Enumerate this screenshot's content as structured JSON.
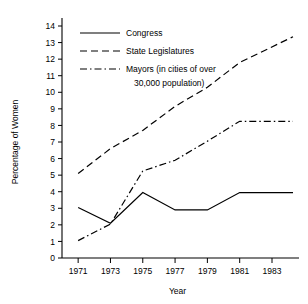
{
  "chart_data": {
    "type": "line",
    "title": "",
    "xlabel": "Year",
    "ylabel": "Percentage of Women",
    "xlim": [
      1970,
      1984.3
    ],
    "ylim": [
      0,
      14
    ],
    "grid": false,
    "legend_position": "top-left",
    "x_ticks": [
      "1971",
      "1973",
      "1975",
      "1977",
      "1979",
      "1981",
      "1983"
    ],
    "x_tick_values": [
      1971,
      1973,
      1975,
      1977,
      1979,
      1981,
      1983
    ],
    "y_ticks": [
      "0",
      "1",
      "2",
      "3",
      "4",
      "5",
      "6",
      "7",
      "8",
      "9",
      "10",
      "11",
      "12",
      "13",
      "14"
    ],
    "y_tick_values": [
      0,
      1,
      2,
      3,
      4,
      5,
      6,
      7,
      8,
      9,
      10,
      11,
      12,
      13,
      14
    ],
    "series": [
      {
        "name": "Congress",
        "style": "solid",
        "x": [
          1971,
          1973,
          1975,
          1977,
          1979,
          1981,
          1984.3
        ],
        "values": [
          3.05,
          2.1,
          3.95,
          2.9,
          2.9,
          3.95,
          3.95
        ]
      },
      {
        "name": "State Legislatures",
        "style": "dashed",
        "x": [
          1971,
          1973,
          1975,
          1977,
          1979,
          1981,
          1984.3
        ],
        "values": [
          5.1,
          6.6,
          7.7,
          9.15,
          10.3,
          11.8,
          13.35
        ]
      },
      {
        "name": "Mayors (in cities of over 30,000 population)",
        "style": "dash-dot",
        "x": [
          1971,
          1973,
          1975,
          1977,
          1979,
          1981,
          1984.3
        ],
        "values": [
          1.05,
          2.05,
          5.25,
          5.9,
          7.05,
          8.25,
          8.25
        ]
      }
    ]
  },
  "legend": {
    "entries": [
      {
        "label": "Congress",
        "style": "solid"
      },
      {
        "label": "State Legislatures",
        "style": "dashed"
      },
      {
        "label": "Mayors (in cities of over",
        "style": "dash-dot"
      },
      {
        "label": "30,000 population)",
        "style": "none"
      }
    ]
  }
}
